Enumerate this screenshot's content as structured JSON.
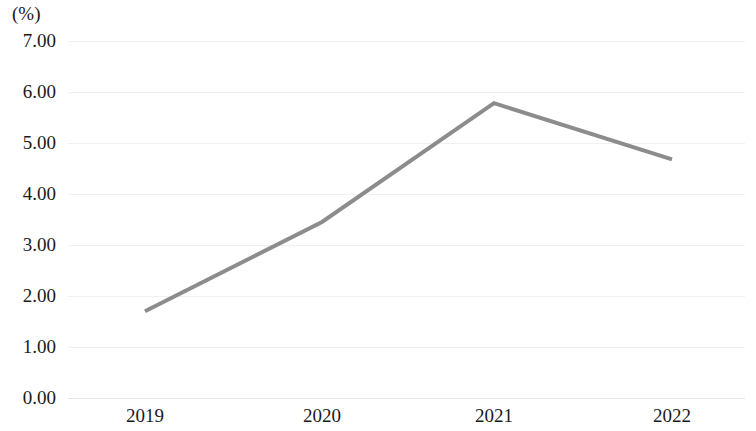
{
  "chart_data": {
    "type": "line",
    "title": "",
    "subtitle": "",
    "xlabel": "",
    "ylabel": "(%)",
    "categories": [
      "2019",
      "2020",
      "2021",
      "2022"
    ],
    "values": [
      1.7,
      3.45,
      5.78,
      4.68
    ],
    "series": [
      {
        "name": "",
        "values": [
          1.7,
          3.45,
          5.78,
          4.68
        ],
        "color": "#8c8c8c"
      }
    ],
    "ylim": [
      0.0,
      7.0
    ],
    "y_ticks": [
      "7.00",
      "6.00",
      "5.00",
      "4.00",
      "3.00",
      "2.00",
      "1.00",
      "0.00"
    ],
    "y_tick_values": [
      7.0,
      6.0,
      5.0,
      4.0,
      3.0,
      2.0,
      1.0,
      0.0
    ],
    "x_ticks": [
      "2019",
      "2020",
      "2021",
      "2022"
    ],
    "grid": true,
    "grid_axis": "y",
    "grid_color": "#f0f0f0",
    "legend": false,
    "legend_position": "none",
    "markers": false,
    "line_width": 4,
    "background_color": "#ffffff",
    "text_color": "#1a1a1a",
    "annotations": []
  },
  "axis": {
    "unit_label": "(%)"
  }
}
